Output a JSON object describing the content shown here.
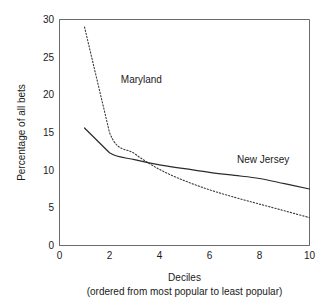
{
  "chart_data": {
    "type": "line",
    "title": "",
    "xlabel": "Deciles",
    "xlabel_sub": "(ordered from most popular to least popular)",
    "ylabel": "Percentage of all bets",
    "xlim": [
      0,
      10
    ],
    "ylim": [
      0,
      30
    ],
    "grid": false,
    "legend_position": "inline-annotation",
    "x_ticks": [
      0,
      1,
      2,
      3,
      4,
      5,
      6,
      7,
      8,
      9,
      10
    ],
    "x_tick_labels": [
      "0",
      "",
      "2",
      "",
      "4",
      "",
      "6",
      "",
      "8",
      "",
      "10"
    ],
    "y_ticks": [
      0,
      5,
      10,
      15,
      20,
      25,
      30
    ],
    "y_tick_labels": [
      "0",
      "5",
      "10",
      "15",
      "20",
      "25",
      "30"
    ],
    "x": [
      1,
      2,
      3,
      4,
      5,
      6,
      7,
      8,
      9,
      10
    ],
    "series": [
      {
        "name": "Maryland",
        "style": "dotted",
        "color": "#3a3a3a",
        "values": [
          29.0,
          15.0,
          12.2,
          10.1,
          8.6,
          7.4,
          6.4,
          5.5,
          4.6,
          3.7
        ],
        "label_x": 2.45,
        "label_y": 21.6
      },
      {
        "name": "New Jersey",
        "style": "solid",
        "color": "#2b2b2b",
        "values": [
          15.6,
          12.3,
          11.4,
          10.7,
          10.2,
          9.7,
          9.3,
          8.9,
          8.2,
          7.5
        ],
        "label_x": 7.1,
        "label_y": 10.9
      }
    ]
  }
}
